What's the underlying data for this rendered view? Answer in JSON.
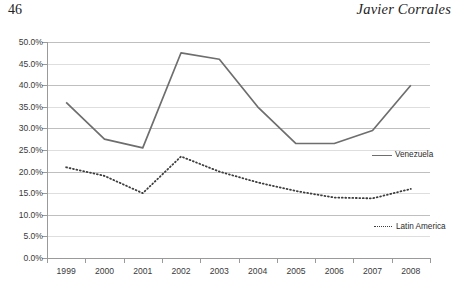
{
  "page": {
    "folio": "46",
    "author": "Javier Corrales"
  },
  "chart_data": {
    "type": "line",
    "title": "",
    "subtitle": "",
    "xlabel": "",
    "ylabel": "",
    "x": [
      "1999",
      "2000",
      "2001",
      "2002",
      "2003",
      "2004",
      "2005",
      "2006",
      "2007",
      "2008"
    ],
    "categories": [
      "1999",
      "2000",
      "2001",
      "2002",
      "2003",
      "2004",
      "2005",
      "2006",
      "2007",
      "2008"
    ],
    "ylim": [
      0,
      50
    ],
    "ytick_labels": [
      "0.0%",
      "5.0%",
      "10.0%",
      "15.0%",
      "20.0%",
      "25.0%",
      "30.0%",
      "35.0%",
      "40.0%",
      "45.0%",
      "50.0%"
    ],
    "ytick_values": [
      0,
      5,
      10,
      15,
      20,
      25,
      30,
      35,
      40,
      45,
      50
    ],
    "grid": "horizontal",
    "legend_position": "inline-right",
    "series": [
      {
        "name": "Venezuela",
        "style": "solid",
        "color": "#6e6e6e",
        "values": [
          36.0,
          27.5,
          25.5,
          47.5,
          46.0,
          35.0,
          26.5,
          26.5,
          29.5,
          40.0
        ]
      },
      {
        "name": "Latin America",
        "style": "dotted",
        "color": "#3d3d3d",
        "values": [
          21.0,
          19.0,
          15.0,
          23.5,
          20.0,
          17.5,
          15.5,
          14.0,
          13.8,
          16.0
        ]
      }
    ],
    "annotations": [
      {
        "text": "Venezuela",
        "series": "Venezuela"
      },
      {
        "text": "Latin America",
        "series": "Latin America"
      }
    ]
  }
}
